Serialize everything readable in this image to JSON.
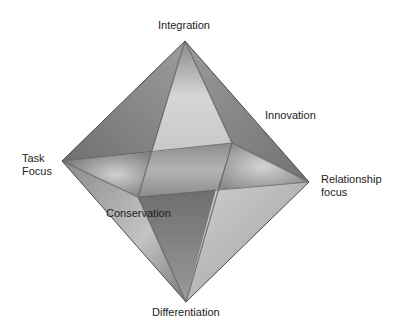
{
  "diagram": {
    "type": "octahedron",
    "labels": {
      "top": "Integration",
      "upper_right": "Innovation",
      "left_line1": "Task",
      "left_line2": "Focus",
      "right_line1": "Relationship",
      "right_line2": "focus",
      "inner_lower_left": "Conservation",
      "bottom": "Differentiation"
    },
    "colors": {
      "edge_dark": "#555555",
      "face_light": "#d8d8d8",
      "face_mid": "#a8a8a8",
      "face_dark": "#7a7a7a"
    }
  }
}
